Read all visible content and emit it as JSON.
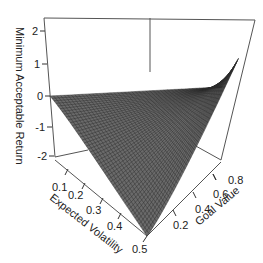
{
  "chart_data": {
    "type": "surface3d",
    "title": "",
    "axes": {
      "x": {
        "label": "Expected Volatility",
        "ticks": [
          "0.1",
          "0.2",
          "0.3",
          "0.4",
          "0.5"
        ],
        "range": [
          0.05,
          0.5
        ]
      },
      "y": {
        "label": "Goal Value",
        "ticks": [
          "0.2",
          "0.4",
          "0.6",
          "0.8"
        ],
        "range": [
          0.05,
          0.95
        ]
      },
      "z": {
        "label": "Minimum Acceptable Return",
        "ticks": [
          "2",
          "1",
          "0",
          "-1",
          "-2"
        ],
        "range": [
          -2.2,
          2.4
        ]
      }
    },
    "surface_description": "Wireframe mesh; z ≈ 0 at low volatility for all goal values, rises to ~2.3 at high volatility & high goal value, falls to ~-2 at high volatility & low goal value",
    "corner_values": [
      {
        "volatility": 0.05,
        "goal": 0.05,
        "z": 0.0
      },
      {
        "volatility": 0.05,
        "goal": 0.95,
        "z": 0.1
      },
      {
        "volatility": 0.5,
        "goal": 0.95,
        "z": 2.3
      },
      {
        "volatility": 0.5,
        "goal": 0.05,
        "z": -2.0
      }
    ],
    "grid": false,
    "legend": "none"
  },
  "labels": {
    "z_axis": "Minimum Acceptable Return",
    "x_axis": "Expected Volatility",
    "y_axis": "Goal Value"
  }
}
